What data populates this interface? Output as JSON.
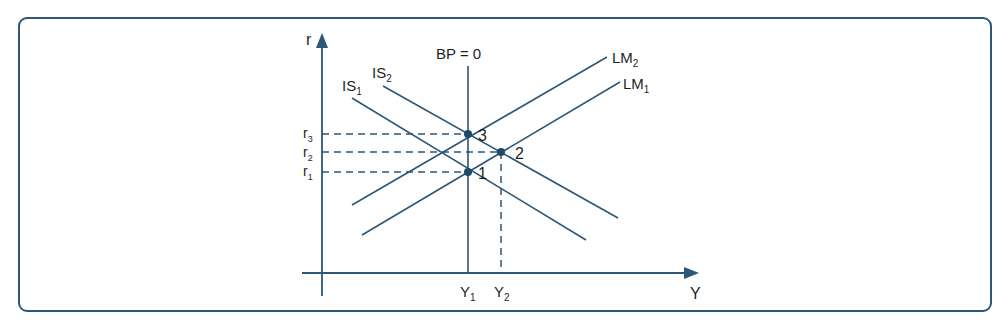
{
  "figure": {
    "axes": {
      "y_axis_label": "r",
      "x_axis_label": "Y"
    },
    "curves": [
      {
        "name": "BP = 0",
        "sub": "",
        "type": "vertical"
      },
      {
        "name": "IS",
        "sub": "1",
        "type": "downward"
      },
      {
        "name": "IS",
        "sub": "2",
        "type": "downward"
      },
      {
        "name": "LM",
        "sub": "1",
        "type": "upward"
      },
      {
        "name": "LM",
        "sub": "2",
        "type": "upward"
      }
    ],
    "bp_label": "BP = 0",
    "is1": {
      "main": "IS",
      "sub": "1"
    },
    "is2": {
      "main": "IS",
      "sub": "2"
    },
    "lm1": {
      "main": "LM",
      "sub": "1"
    },
    "lm2": {
      "main": "LM",
      "sub": "2"
    },
    "r_ticks": [
      {
        "main": "r",
        "sub": "3"
      },
      {
        "main": "r",
        "sub": "2"
      },
      {
        "main": "r",
        "sub": "1"
      }
    ],
    "y_ticks": [
      {
        "main": "Y",
        "sub": "1"
      },
      {
        "main": "Y",
        "sub": "2"
      }
    ],
    "points": [
      {
        "label": "1",
        "description": "IS1 ∩ LM1 ∩ BP=0 at (Y1, r1)"
      },
      {
        "label": "2",
        "description": "IS2 ∩ LM1 at (Y2, r2)"
      },
      {
        "label": "3",
        "description": "IS2 ∩ LM2 ∩ BP=0 at (Y1, r3)"
      }
    ],
    "colors": {
      "line": "#2d5677",
      "frame": "#2d5677",
      "text": "#1f1f1f"
    }
  }
}
